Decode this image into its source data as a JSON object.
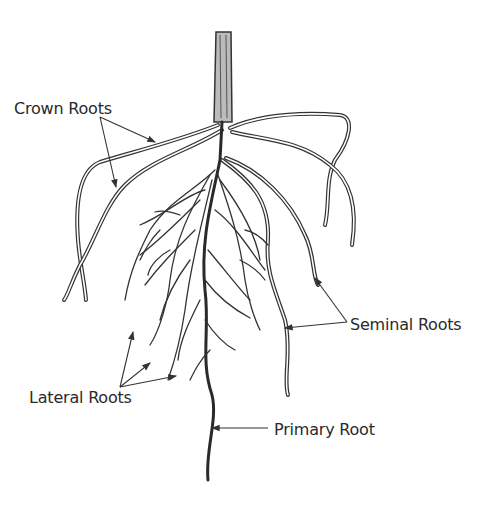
{
  "diagram": {
    "labels": {
      "crown_roots": "Crown Roots",
      "seminal_roots": "Seminal Roots",
      "lateral_roots": "Lateral Roots",
      "primary_root": "Primary Root"
    },
    "colors": {
      "ink": "#2a2a2a",
      "background": "#ffffff"
    }
  }
}
